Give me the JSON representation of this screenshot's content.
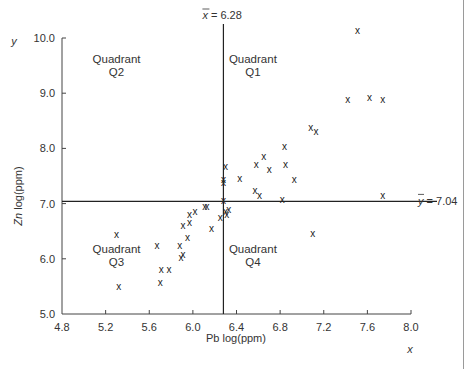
{
  "chart_data": {
    "type": "scatter",
    "title": "",
    "xlabel": "Pb log(ppm)",
    "ylabel": "Zn log(ppm)",
    "x_axis_symbol": "x",
    "y_axis_symbol": "y",
    "xlim": [
      4.8,
      8.0
    ],
    "ylim": [
      5.0,
      10.0
    ],
    "x_ticks": [
      "4.8",
      "5.2",
      "5.6",
      "6.0",
      "6.4",
      "6.8",
      "7.2",
      "7.6",
      "8.0"
    ],
    "y_ticks": [
      "5.0",
      "6.0",
      "7.0",
      "8.0",
      "9.0",
      "10.0"
    ],
    "grid": false,
    "marker": "x",
    "mean_lines": {
      "x_mean": {
        "value": 6.28,
        "label": "= 6.28",
        "symbol": "x"
      },
      "y_mean": {
        "value": 7.04,
        "label": "= 7.04",
        "symbol": "y"
      }
    },
    "quadrants": [
      {
        "id": "Q1",
        "line1": "Quadrant",
        "line2": "Q1",
        "x": 6.55,
        "y": 9.55
      },
      {
        "id": "Q2",
        "line1": "Quadrant",
        "line2": "Q2",
        "x": 5.3,
        "y": 9.55
      },
      {
        "id": "Q3",
        "line1": "Quadrant",
        "line2": "Q3",
        "x": 5.3,
        "y": 6.1
      },
      {
        "id": "Q4",
        "line1": "Quadrant",
        "line2": "Q4",
        "x": 6.55,
        "y": 6.1
      }
    ],
    "points": [
      {
        "x": 7.51,
        "y": 10.13
      },
      {
        "x": 7.42,
        "y": 8.88
      },
      {
        "x": 7.62,
        "y": 8.92
      },
      {
        "x": 7.74,
        "y": 8.88
      },
      {
        "x": 7.08,
        "y": 8.37
      },
      {
        "x": 7.13,
        "y": 8.3
      },
      {
        "x": 6.84,
        "y": 8.03
      },
      {
        "x": 6.65,
        "y": 7.86
      },
      {
        "x": 6.58,
        "y": 7.7
      },
      {
        "x": 6.7,
        "y": 7.61
      },
      {
        "x": 6.85,
        "y": 7.7
      },
      {
        "x": 6.3,
        "y": 7.68
      },
      {
        "x": 6.28,
        "y": 7.43
      },
      {
        "x": 6.28,
        "y": 7.38
      },
      {
        "x": 6.93,
        "y": 7.43
      },
      {
        "x": 6.43,
        "y": 7.45
      },
      {
        "x": 6.57,
        "y": 7.23
      },
      {
        "x": 6.61,
        "y": 7.15
      },
      {
        "x": 6.82,
        "y": 7.08
      },
      {
        "x": 6.28,
        "y": 7.06
      },
      {
        "x": 7.74,
        "y": 7.15
      },
      {
        "x": 6.3,
        "y": 6.85
      },
      {
        "x": 6.33,
        "y": 6.9
      },
      {
        "x": 6.31,
        "y": 6.81
      },
      {
        "x": 6.17,
        "y": 6.54
      },
      {
        "x": 6.11,
        "y": 6.94
      },
      {
        "x": 6.13,
        "y": 6.94
      },
      {
        "x": 6.02,
        "y": 6.86
      },
      {
        "x": 6.25,
        "y": 6.74
      },
      {
        "x": 5.91,
        "y": 6.61
      },
      {
        "x": 5.97,
        "y": 6.81
      },
      {
        "x": 5.97,
        "y": 6.66
      },
      {
        "x": 5.88,
        "y": 6.24
      },
      {
        "x": 5.95,
        "y": 6.39
      },
      {
        "x": 5.89,
        "y": 6.03
      },
      {
        "x": 5.91,
        "y": 6.07
      },
      {
        "x": 5.3,
        "y": 6.44
      },
      {
        "x": 5.67,
        "y": 6.24
      },
      {
        "x": 5.71,
        "y": 5.81
      },
      {
        "x": 5.78,
        "y": 5.81
      },
      {
        "x": 5.7,
        "y": 5.57
      },
      {
        "x": 5.32,
        "y": 5.5
      },
      {
        "x": 7.1,
        "y": 6.45
      }
    ]
  }
}
